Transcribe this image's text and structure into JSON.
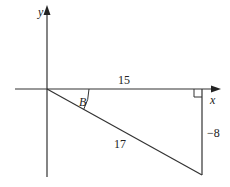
{
  "diagram": {
    "type": "right-triangle-on-axes",
    "axes": {
      "x_label": "x",
      "y_label": "y"
    },
    "labels": {
      "horizontal_side": "15",
      "vertical_side": "−8",
      "hypotenuse": "17",
      "angle": "B"
    },
    "colors": {
      "line": "#333333",
      "background": "#ffffff"
    }
  }
}
